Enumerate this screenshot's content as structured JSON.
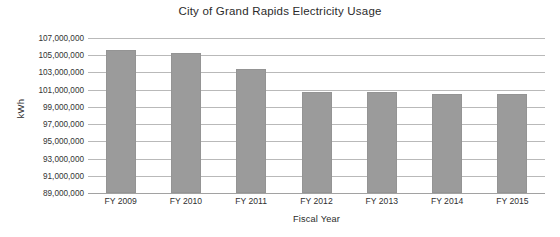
{
  "chart_data": {
    "type": "bar",
    "title": "City of Grand Rapids Electricity Usage",
    "xlabel": "Fiscal Year",
    "ylabel": "kWh",
    "categories": [
      "FY 2009",
      "FY 2010",
      "FY 2011",
      "FY 2012",
      "FY 2013",
      "FY 2014",
      "FY 2015"
    ],
    "values": [
      105600000,
      105300000,
      103400000,
      100750000,
      100750000,
      100500000,
      100450000
    ],
    "ylim": [
      89000000,
      107000000
    ],
    "ytick_labels": [
      "107,000,000",
      "105,000,000",
      "103,000,000",
      "101,000,000",
      "99,000,000",
      "97,000,000",
      "95,000,000",
      "93,000,000",
      "91,000,000",
      "89,000,000"
    ],
    "ytick_values": [
      107000000,
      105000000,
      103000000,
      101000000,
      99000000,
      97000000,
      95000000,
      93000000,
      91000000,
      89000000
    ],
    "grid": true,
    "legend": false,
    "bar_color": "#9b9b9b",
    "gridline_color": "#b9b9b9",
    "text_color": "#2b2b2b"
  }
}
